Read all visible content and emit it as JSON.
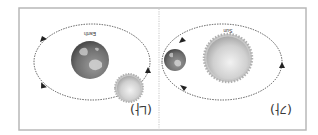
{
  "orientation": "rotated-180",
  "colors": {
    "frame": "#b8b8b8",
    "orbit": "#444444",
    "sun_core": "#e8e8e8",
    "sun_edge": "#a9a9a9",
    "earth_ocean": "#6e6e6e",
    "earth_land": "#d4d4d4"
  },
  "panels": [
    {
      "id": "na",
      "label": "(나)",
      "center_body": {
        "name": "earth",
        "tag": "Earth"
      },
      "orbiting_body": {
        "name": "sun"
      },
      "description": "Sun orbiting the Earth (geocentric model)"
    },
    {
      "id": "ga",
      "label": "(가)",
      "center_body": {
        "name": "sun",
        "tag": "Sun"
      },
      "orbiting_body": {
        "name": "earth"
      },
      "description": "Earth orbiting the Sun (heliocentric model)"
    }
  ]
}
